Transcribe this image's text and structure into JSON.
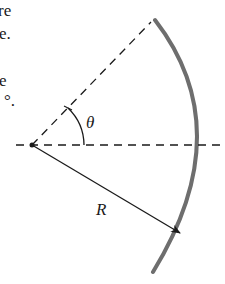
{
  "text_fragments": [
    {
      "text": "re",
      "x": -2,
      "y": 2
    },
    {
      "text": "e.",
      "x": -1,
      "y": 25
    },
    {
      "text": "e",
      "x": -1,
      "y": 72
    },
    {
      "text": "°.",
      "x": 4,
      "y": 92
    }
  ],
  "diagram": {
    "center": {
      "x": 32,
      "y": 145
    },
    "radius_label": "R",
    "angle_label": "θ",
    "colors": {
      "arc": "#6e6e6e",
      "lines": "#1a1a1a"
    }
  }
}
